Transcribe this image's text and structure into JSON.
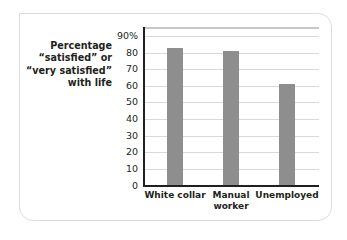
{
  "chart_data": {
    "type": "bar",
    "title": "",
    "ylabel": "Percentage “satisfied” or “very satisfied” with life",
    "ylabel_lines": [
      "Percentage",
      "“satisfied” or",
      "“very satisfied”",
      "with life"
    ],
    "xlabel": "",
    "categories": [
      "White collar",
      "Manual worker",
      "Unemployed"
    ],
    "category_lines": [
      [
        "White collar"
      ],
      [
        "Manual",
        "worker"
      ],
      [
        "Unemployed"
      ]
    ],
    "values": [
      83,
      81,
      61
    ],
    "ylim": [
      0,
      90
    ],
    "yticks": [
      0,
      10,
      20,
      30,
      40,
      50,
      60,
      70,
      80,
      90
    ],
    "ytick_labels": [
      "0",
      "10",
      "20",
      "30",
      "40",
      "50",
      "60",
      "70",
      "80",
      "90%"
    ],
    "grid": true,
    "legend": null,
    "colors": {
      "bar": "#8e8e8e",
      "grid": "#d9d9d9",
      "axis": "#231f20",
      "frame": "#dcdcdc"
    }
  }
}
